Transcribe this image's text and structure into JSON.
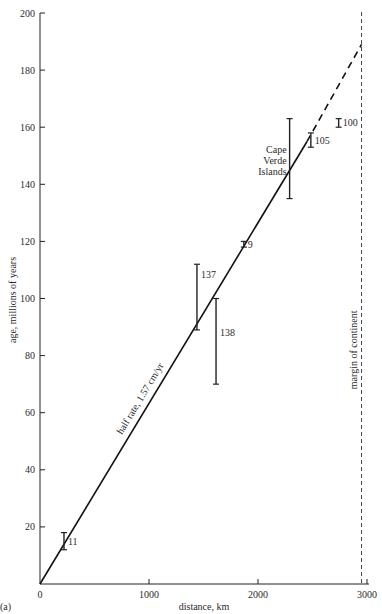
{
  "chart_data": {
    "type": "scatter",
    "panel_label": "(a)",
    "title": "",
    "xlabel": "distance, km",
    "ylabel": "age, millions of years",
    "xlim": [
      0,
      3000
    ],
    "ylim": [
      0,
      200
    ],
    "x_ticks": [
      0,
      1000,
      2000,
      3000
    ],
    "y_ticks": [
      20,
      40,
      60,
      80,
      100,
      120,
      140,
      160,
      180,
      200
    ],
    "grid": false,
    "fit_line": {
      "label": "half rate, 1.57 cm/yr",
      "solid_from": [
        0,
        0
      ],
      "solid_to": [
        2450,
        155
      ],
      "dashed_to": [
        2950,
        189
      ]
    },
    "reference_line": {
      "label": "margin of continent",
      "x": 2950,
      "style": "dashed"
    },
    "error_bars": [
      {
        "label": "11",
        "x": 220,
        "y_min": 12,
        "y_max": 18
      },
      {
        "label": "137",
        "x": 1440,
        "y_min": 89,
        "y_max": 112
      },
      {
        "label": "138",
        "x": 1615,
        "y_min": 70,
        "y_max": 100
      },
      {
        "label": "9",
        "x": 1870,
        "y_min": 118,
        "y_max": 120
      },
      {
        "label": "Cape Verde Islands",
        "x": 2290,
        "y_min": 135,
        "y_max": 163
      },
      {
        "label": "105",
        "x": 2485,
        "y_min": 153,
        "y_max": 158
      },
      {
        "label": "100",
        "x": 2740,
        "y_min": 160,
        "y_max": 163
      }
    ]
  }
}
